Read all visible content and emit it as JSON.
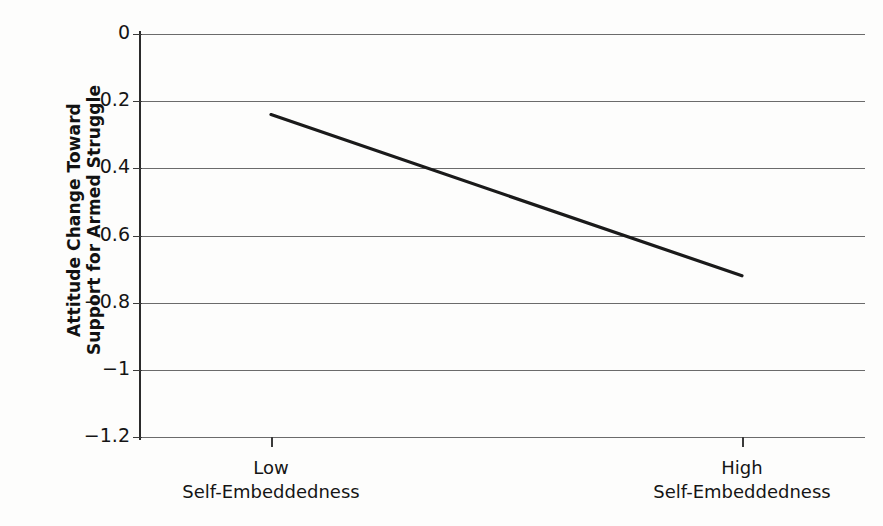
{
  "chart_data": {
    "type": "line",
    "title": "",
    "xlabel": "",
    "ylabel": "Attitude Change Toward Support for Armed Struggle",
    "ylabel_lines": [
      "Attitude Change Toward",
      "Support for Armed Struggle"
    ],
    "categories": [
      "Low Self-Embeddedness",
      "High Self-Embeddedness"
    ],
    "x_tick_labels": [
      {
        "line1": "Low",
        "line2": "Self-Embeddedness"
      },
      {
        "line1": "High",
        "line2": "Self-Embeddedness"
      }
    ],
    "y_tick_labels": [
      "0",
      "0.2",
      "0.4",
      "0.6",
      "−0.8",
      "−1",
      "−1.2"
    ],
    "y_tick_values": [
      0,
      -0.2,
      -0.4,
      -0.6,
      -0.8,
      -1,
      -1.2
    ],
    "ylim": [
      -1.2,
      0
    ],
    "yaxis_inverted": true,
    "grid": true,
    "legend": false,
    "series": [
      {
        "name": "Attitude change",
        "values": [
          -0.24,
          -0.72
        ]
      }
    ],
    "colors": {
      "line": "#1a1a1a",
      "gridline": "#6b6b6b",
      "axis": "#2b2b2b",
      "background": "#fdfdfc",
      "text": "#151515"
    }
  }
}
